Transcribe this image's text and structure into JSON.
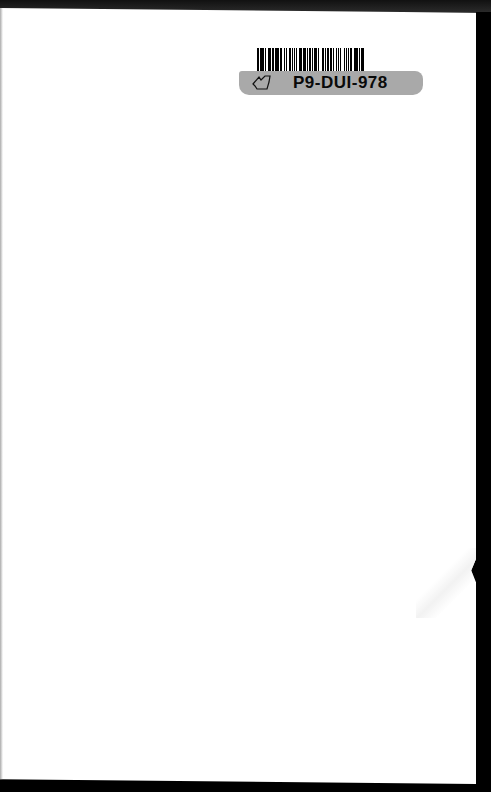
{
  "page": {
    "content": "blank",
    "background_color": "#ffffff",
    "border_color": "#000000"
  },
  "sticker": {
    "code": "P9-DUI-978",
    "icon": "hand-pointer-icon",
    "strip_color": "#a9a9a9",
    "barcode_pattern": [
      2,
      1,
      1,
      1,
      3,
      1,
      1,
      2,
      2,
      1,
      1,
      1,
      2,
      1,
      3,
      1,
      1,
      1,
      2,
      2,
      1,
      1,
      1,
      3,
      2,
      1,
      1,
      1,
      2,
      1,
      1,
      2,
      3,
      1,
      1,
      1,
      2,
      1,
      1,
      1,
      2,
      2,
      1,
      1,
      3,
      1,
      1,
      2,
      1,
      1,
      2,
      1,
      1,
      1,
      3,
      1,
      2,
      1,
      1,
      2,
      1,
      1,
      2,
      1,
      1,
      3,
      1,
      1,
      2,
      1,
      1,
      1,
      2,
      2,
      1,
      1,
      3,
      1,
      1,
      1,
      2,
      1,
      1,
      2
    ]
  }
}
